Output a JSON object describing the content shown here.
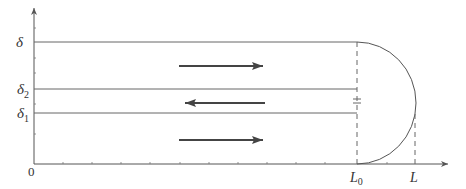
{
  "diagram": {
    "axes": {
      "origin_label": "0",
      "color": "#555555",
      "x_ticks_count": 13,
      "y_ticks_count": 7
    },
    "y_levels": [
      {
        "id": "delta",
        "label": "δ",
        "subscript": ""
      },
      {
        "id": "delta2",
        "label": "δ",
        "subscript": "2"
      },
      {
        "id": "delta1",
        "label": "δ",
        "subscript": "1"
      }
    ],
    "x_markers": [
      {
        "id": "L0",
        "label": "L",
        "subscript": "0"
      },
      {
        "id": "L",
        "label": "L",
        "subscript": ""
      }
    ],
    "flow_arrows": [
      {
        "id": "top-flow",
        "direction": "right"
      },
      {
        "id": "middle-flow",
        "direction": "left"
      },
      {
        "id": "bottom-flow",
        "direction": "right"
      }
    ],
    "break_mark": "=",
    "colors": {
      "lines": "#666666",
      "arrows": "#444444",
      "text": "#333333"
    }
  }
}
